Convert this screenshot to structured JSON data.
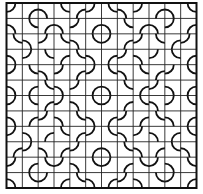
{
  "diagram": {
    "title": "",
    "type": "quarter-circle tile pattern (quilt block)",
    "grid": {
      "rows": 12,
      "cols": 12,
      "origin_x": 6.5,
      "origin_y": 3,
      "width": 190,
      "height": 185
    },
    "arc_radius_ratio": 0.58,
    "colors": {
      "background": "#ffffff",
      "grid_line": "#222222",
      "arc_line": "#111111",
      "border": "#111111"
    },
    "quadrant_corners": [
      [
        "tl",
        "br",
        "bl",
        "tr",
        "br",
        "tl"
      ],
      [
        "bl",
        "tr",
        "br",
        "bl",
        "tl",
        "br"
      ],
      [
        "tr",
        "bl",
        "tl",
        "tr",
        "bl",
        "tr"
      ],
      [
        "bl",
        "tl",
        "tr",
        "br",
        "tr",
        "bl"
      ],
      [
        "tl",
        "tr",
        "bl",
        "tl",
        "br",
        "tl"
      ],
      [
        "bl",
        "br",
        "tr",
        "bl",
        "tl",
        "br"
      ]
    ],
    "symmetry": "4-fold mirror about the center",
    "features": [
      "center circle at grid vertex (6,6)",
      "semicircle domes",
      "S-curve chains"
    ]
  }
}
